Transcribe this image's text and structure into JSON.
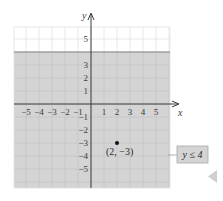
{
  "chart_data": {
    "type": "area",
    "title": "",
    "xlabel": "x",
    "ylabel": "y",
    "xlim": [
      -6,
      6
    ],
    "ylim": [
      -6,
      6
    ],
    "grid": true,
    "x_ticks": [
      -5,
      -4,
      -3,
      -2,
      -1,
      1,
      2,
      3,
      4,
      5
    ],
    "x_tick_labels": [
      "−5",
      "−4",
      "−3",
      "−2",
      "−1",
      "1",
      "2",
      "3",
      "4",
      "5"
    ],
    "y_ticks": [
      5,
      3,
      2,
      1,
      -1,
      -2,
      -3,
      -4,
      -5
    ],
    "y_tick_labels": [
      "5",
      "3",
      "2",
      "1",
      "−1",
      "−2",
      "−3",
      "−4",
      "−5"
    ],
    "boundary_line": {
      "equation": "y = 4",
      "y": 4,
      "style": "solid"
    },
    "shaded_region": {
      "inequality": "y ≤ 4",
      "side": "below",
      "color": "#d4d4d4"
    },
    "points": [
      {
        "x": 2,
        "y": -3,
        "label": "(2, −3)"
      }
    ],
    "annotations": [
      {
        "text": "y ≤ 4",
        "type": "callout-box"
      }
    ]
  },
  "colors": {
    "shade": "#d4d4d4",
    "grid_shaded": "#c4c4c4",
    "grid_unshaded": "#e2e2e2",
    "axis": "#3a3a3a",
    "boundary": "#8a8a8a",
    "callout_bg": "#d4d4d4",
    "nav_arrow": "#cfcfcf"
  }
}
